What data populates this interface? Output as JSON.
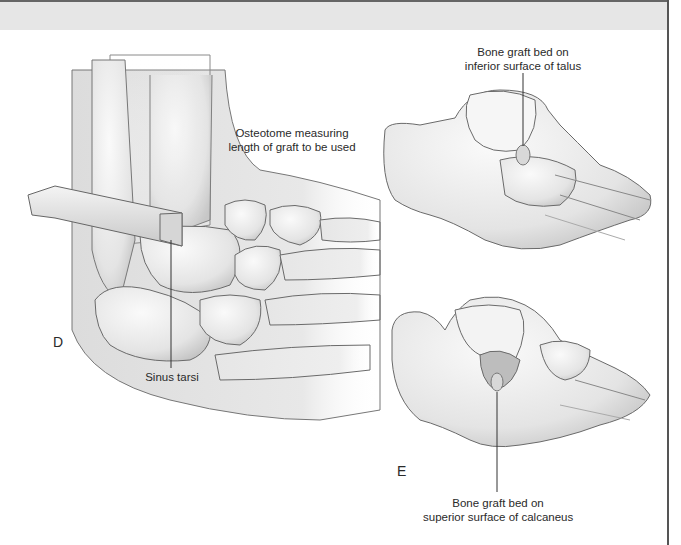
{
  "figure": {
    "panels": [
      {
        "letter": "D",
        "labels": {
          "osteotome_line1": "Osteotome measuring",
          "osteotome_line2": "length of graft to be used",
          "sinus_tarsi": "Sinus tarsi"
        }
      },
      {
        "letter": "",
        "labels": {
          "talus_line1": "Bone graft bed on",
          "talus_line2": "inferior surface of talus"
        }
      },
      {
        "letter": "E",
        "labels": {
          "calcaneus_line1": "Bone graft bed on",
          "calcaneus_line2": "superior surface of calcaneus"
        }
      }
    ],
    "colors": {
      "band": "#e6e6e6",
      "border": "#555555",
      "bone_fill": "#f2f2f2",
      "bone_shade": "#cfcfcf",
      "outline": "#6a6a6a",
      "text": "#2a2a2a"
    }
  }
}
